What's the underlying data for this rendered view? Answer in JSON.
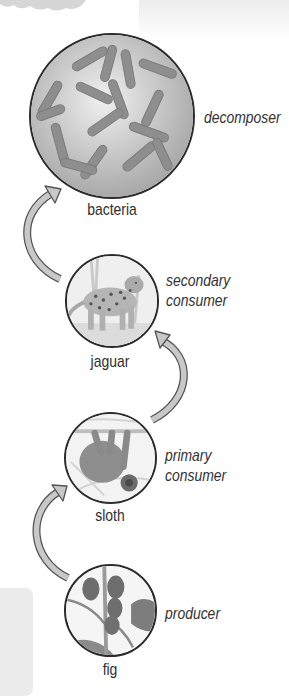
{
  "diagram": {
    "type": "food-chain",
    "direction": "bottom-to-top",
    "colors": {
      "circle_border": "#2b2b2b",
      "arrow_fill": "#c8c8c8",
      "arrow_stroke": "#555555",
      "label_text": "#333333",
      "side_box": "#ebebeb"
    },
    "levels": [
      {
        "organism": "bacteria",
        "role": "decomposer",
        "icon": "bacteria-icon"
      },
      {
        "organism": "jaguar",
        "role_line1": "secondary",
        "role_line2": "consumer",
        "icon": "jaguar-icon"
      },
      {
        "organism": "sloth",
        "role_line1": "primary",
        "role_line2": "consumer",
        "icon": "sloth-icon"
      },
      {
        "organism": "fig",
        "role": "producer",
        "icon": "fig-icon"
      }
    ],
    "arrows": [
      {
        "from": "fig",
        "to": "sloth"
      },
      {
        "from": "sloth",
        "to": "jaguar"
      },
      {
        "from": "jaguar",
        "to": "bacteria"
      }
    ]
  }
}
